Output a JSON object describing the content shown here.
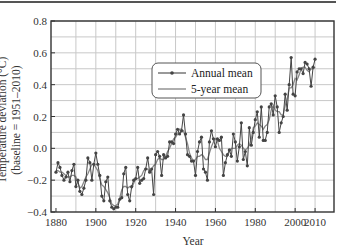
{
  "chart_data": {
    "type": "line",
    "title": "",
    "xlabel": "Year",
    "ylabel": "Temperature deviation (°C)",
    "ylabel_sub": "(baseline = 1951–2010)",
    "xlim": [
      1877,
      2019
    ],
    "ylim": [
      -0.4,
      0.8
    ],
    "x_ticks": [
      1880,
      1900,
      1920,
      1940,
      1960,
      1980,
      2000,
      2010
    ],
    "x_tick_labels": [
      "1880",
      "1900",
      "1920",
      "1940",
      "1960",
      "1980",
      "2000",
      "2010"
    ],
    "y_ticks": [
      -0.4,
      -0.2,
      0.0,
      0.2,
      0.4,
      0.6,
      0.8
    ],
    "y_tick_labels": [
      "−0.4",
      "−0.2",
      "0.0",
      "0.2",
      "0.4",
      "0.6",
      "0.8"
    ],
    "grid": true,
    "legend_position": "upper center-right",
    "legend": [
      "Annual mean",
      "5-year mean"
    ],
    "x": [
      1880,
      1881,
      1882,
      1883,
      1884,
      1885,
      1886,
      1887,
      1888,
      1889,
      1890,
      1891,
      1892,
      1893,
      1894,
      1895,
      1896,
      1897,
      1898,
      1899,
      1900,
      1901,
      1902,
      1903,
      1904,
      1905,
      1906,
      1907,
      1908,
      1909,
      1910,
      1911,
      1912,
      1913,
      1914,
      1915,
      1916,
      1917,
      1918,
      1919,
      1920,
      1921,
      1922,
      1923,
      1924,
      1925,
      1926,
      1927,
      1928,
      1929,
      1930,
      1931,
      1932,
      1933,
      1934,
      1935,
      1936,
      1937,
      1938,
      1939,
      1940,
      1941,
      1942,
      1943,
      1944,
      1945,
      1946,
      1947,
      1948,
      1949,
      1950,
      1951,
      1952,
      1953,
      1954,
      1955,
      1956,
      1957,
      1958,
      1959,
      1960,
      1961,
      1962,
      1963,
      1964,
      1965,
      1966,
      1967,
      1968,
      1969,
      1970,
      1971,
      1972,
      1973,
      1974,
      1975,
      1976,
      1977,
      1978,
      1979,
      1980,
      1981,
      1982,
      1983,
      1984,
      1985,
      1986,
      1987,
      1988,
      1989,
      1990,
      1991,
      1992,
      1993,
      1994,
      1995,
      1996,
      1997,
      1998,
      1999,
      2000,
      2001,
      2002,
      2003,
      2004,
      2005,
      2006,
      2007,
      2008,
      2009,
      2010
    ],
    "series": [
      {
        "name": "Annual mean",
        "values": [
          -0.15,
          -0.09,
          -0.12,
          -0.17,
          -0.2,
          -0.18,
          -0.15,
          -0.21,
          -0.14,
          -0.1,
          -0.24,
          -0.2,
          -0.27,
          -0.29,
          -0.25,
          -0.2,
          -0.06,
          -0.09,
          -0.2,
          -0.1,
          -0.03,
          -0.1,
          -0.17,
          -0.3,
          -0.33,
          -0.21,
          -0.18,
          -0.33,
          -0.37,
          -0.38,
          -0.37,
          -0.37,
          -0.32,
          -0.31,
          -0.16,
          -0.12,
          -0.29,
          -0.33,
          -0.24,
          -0.2,
          -0.19,
          -0.12,
          -0.22,
          -0.2,
          -0.19,
          -0.13,
          -0.06,
          -0.15,
          -0.13,
          -0.29,
          -0.04,
          -0.02,
          -0.05,
          -0.17,
          -0.04,
          -0.06,
          -0.05,
          0.04,
          0.04,
          0.03,
          0.09,
          0.12,
          0.09,
          0.11,
          0.21,
          0.09,
          -0.04,
          -0.05,
          -0.08,
          -0.08,
          -0.17,
          -0.02,
          0.04,
          0.07,
          -0.13,
          -0.15,
          -0.2,
          0.04,
          0.11,
          0.06,
          0.01,
          0.06,
          0.05,
          0.07,
          -0.17,
          -0.09,
          -0.04,
          -0.01,
          -0.05,
          0.09,
          0.04,
          -0.08,
          0.01,
          0.16,
          -0.07,
          -0.02,
          -0.11,
          0.13,
          0.02,
          0.1,
          0.18,
          0.23,
          0.07,
          0.26,
          0.05,
          0.05,
          0.1,
          0.26,
          0.28,
          0.21,
          0.33,
          0.26,
          0.1,
          0.16,
          0.2,
          0.34,
          0.24,
          0.4,
          0.57,
          0.34,
          0.33,
          0.48,
          0.5,
          0.5,
          0.47,
          0.54,
          0.53,
          0.5,
          0.39,
          0.51,
          0.56
        ]
      },
      {
        "name": "5-year mean",
        "values": [
          -0.14,
          -0.14,
          -0.15,
          -0.15,
          -0.16,
          -0.17,
          -0.18,
          -0.18,
          -0.17,
          -0.17,
          -0.18,
          -0.22,
          -0.25,
          -0.24,
          -0.21,
          -0.18,
          -0.16,
          -0.13,
          -0.1,
          -0.1,
          -0.12,
          -0.14,
          -0.19,
          -0.23,
          -0.24,
          -0.26,
          -0.28,
          -0.31,
          -0.35,
          -0.36,
          -0.36,
          -0.35,
          -0.31,
          -0.26,
          -0.24,
          -0.24,
          -0.25,
          -0.24,
          -0.25,
          -0.22,
          -0.19,
          -0.19,
          -0.18,
          -0.17,
          -0.14,
          -0.13,
          -0.13,
          -0.15,
          -0.13,
          -0.11,
          -0.1,
          -0.07,
          -0.06,
          -0.07,
          -0.07,
          -0.05,
          -0.02,
          0.0,
          0.03,
          0.06,
          0.07,
          0.09,
          0.12,
          0.12,
          0.11,
          0.07,
          0.03,
          -0.03,
          -0.06,
          -0.08,
          -0.07,
          -0.05,
          -0.05,
          -0.04,
          -0.05,
          -0.07,
          -0.07,
          -0.03,
          0.01,
          0.04,
          0.06,
          0.05,
          0.0,
          -0.02,
          -0.04,
          -0.05,
          -0.05,
          -0.02,
          0.0,
          0.0,
          0.0,
          0.02,
          0.03,
          0.02,
          0.0,
          -0.01,
          0.0,
          0.02,
          0.06,
          0.13,
          0.14,
          0.16,
          0.15,
          0.14,
          0.12,
          0.14,
          0.15,
          0.18,
          0.24,
          0.27,
          0.24,
          0.23,
          0.23,
          0.21,
          0.21,
          0.27,
          0.31,
          0.38,
          0.38,
          0.4,
          0.44,
          0.43,
          0.46,
          0.5,
          0.51,
          0.51,
          0.49,
          0.48,
          0.5,
          0.5,
          0.51
        ]
      }
    ]
  },
  "figure": {
    "ylabel_line1": "Temperature deviation (°C)",
    "ylabel_line2": "(baseline = 1951–2010)",
    "xlabel": "Year",
    "legend_annual": "Annual mean",
    "legend_5yr": "5-year mean"
  }
}
